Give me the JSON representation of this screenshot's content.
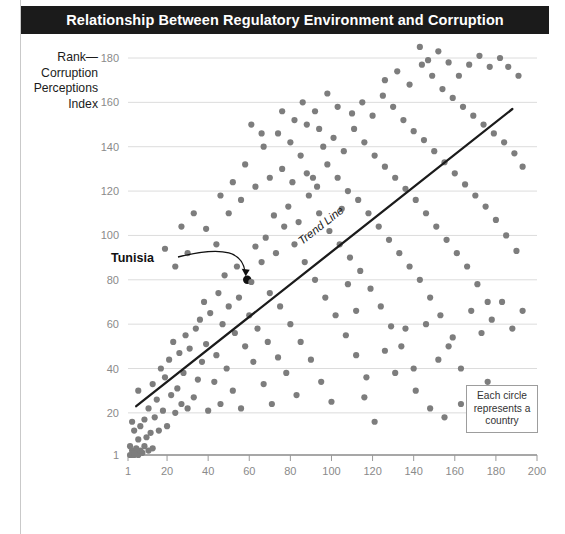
{
  "figure": {
    "title": "Relationship Between Regulatory Environment and Corruption",
    "legend_note": "Each circle represents a country"
  },
  "chart_data": {
    "type": "scatter",
    "title": "Relationship Between Regulatory Environment and Corruption",
    "xlabel": "Rank—Ease of Doing Business",
    "ylabel": "Rank—Corruption Perceptions Index",
    "xlim": [
      1,
      200
    ],
    "ylim": [
      1,
      188
    ],
    "grid": "horizontal",
    "legend_position": "bottom-right",
    "xticks": [
      1,
      20,
      40,
      60,
      80,
      100,
      120,
      140,
      160,
      180,
      200
    ],
    "yticks": [
      1,
      20,
      40,
      60,
      80,
      100,
      120,
      140,
      160,
      180
    ],
    "marker_color": "#7d7d7d",
    "highlight_color": "#111111",
    "annotations": [
      {
        "label": "Tunisia",
        "x": 59,
        "y": 80,
        "kind": "point-callout"
      },
      {
        "label": "Trend Line",
        "x": 98,
        "y": 96,
        "kind": "line-label"
      }
    ],
    "trendline": {
      "x1": 5,
      "y1": 23,
      "x2": 188,
      "y2": 157,
      "color": "#1b1b1b"
    },
    "points": [
      [
        2,
        1
      ],
      [
        3,
        1
      ],
      [
        4,
        1
      ],
      [
        5,
        2
      ],
      [
        6,
        1
      ],
      [
        7,
        3
      ],
      [
        3,
        3
      ],
      [
        4,
        2
      ],
      [
        8,
        2
      ],
      [
        5,
        4
      ],
      [
        2,
        5
      ],
      [
        9,
        5
      ],
      [
        11,
        3
      ],
      [
        13,
        4
      ],
      [
        6,
        8
      ],
      [
        10,
        9
      ],
      [
        12,
        11
      ],
      [
        4,
        12
      ],
      [
        7,
        14
      ],
      [
        16,
        12
      ],
      [
        3,
        16
      ],
      [
        9,
        17
      ],
      [
        14,
        18
      ],
      [
        20,
        14
      ],
      [
        18,
        21
      ],
      [
        11,
        22
      ],
      [
        24,
        20
      ],
      [
        15,
        26
      ],
      [
        22,
        28
      ],
      [
        27,
        24
      ],
      [
        6,
        30
      ],
      [
        13,
        33
      ],
      [
        19,
        36
      ],
      [
        25,
        31
      ],
      [
        30,
        22
      ],
      [
        33,
        27
      ],
      [
        17,
        40
      ],
      [
        28,
        38
      ],
      [
        35,
        35
      ],
      [
        40,
        21
      ],
      [
        21,
        44
      ],
      [
        26,
        47
      ],
      [
        31,
        49
      ],
      [
        37,
        43
      ],
      [
        43,
        34
      ],
      [
        46,
        24
      ],
      [
        23,
        52
      ],
      [
        29,
        55
      ],
      [
        34,
        58
      ],
      [
        39,
        51
      ],
      [
        44,
        46
      ],
      [
        49,
        40
      ],
      [
        52,
        30
      ],
      [
        56,
        22
      ],
      [
        36,
        62
      ],
      [
        41,
        65
      ],
      [
        47,
        60
      ],
      [
        53,
        56
      ],
      [
        58,
        50
      ],
      [
        62,
        43
      ],
      [
        67,
        33
      ],
      [
        71,
        24
      ],
      [
        38,
        70
      ],
      [
        45,
        74
      ],
      [
        50,
        68
      ],
      [
        55,
        72
      ],
      [
        60,
        64
      ],
      [
        64,
        58
      ],
      [
        69,
        52
      ],
      [
        74,
        45
      ],
      [
        78,
        38
      ],
      [
        83,
        28
      ],
      [
        59,
        80
      ],
      [
        48,
        82
      ],
      [
        54,
        86
      ],
      [
        61,
        79
      ],
      [
        66,
        88
      ],
      [
        70,
        74
      ],
      [
        75,
        68
      ],
      [
        80,
        60
      ],
      [
        85,
        52
      ],
      [
        90,
        44
      ],
      [
        95,
        34
      ],
      [
        100,
        25
      ],
      [
        63,
        95
      ],
      [
        68,
        99
      ],
      [
        73,
        92
      ],
      [
        77,
        104
      ],
      [
        82,
        96
      ],
      [
        87,
        88
      ],
      [
        92,
        80
      ],
      [
        97,
        72
      ],
      [
        102,
        64
      ],
      [
        107,
        55
      ],
      [
        112,
        46
      ],
      [
        117,
        36
      ],
      [
        72,
        109
      ],
      [
        79,
        113
      ],
      [
        84,
        106
      ],
      [
        89,
        118
      ],
      [
        94,
        110
      ],
      [
        99,
        102
      ],
      [
        104,
        96
      ],
      [
        109,
        90
      ],
      [
        114,
        84
      ],
      [
        119,
        76
      ],
      [
        124,
        68
      ],
      [
        129,
        59
      ],
      [
        134,
        50
      ],
      [
        140,
        40
      ],
      [
        81,
        124
      ],
      [
        88,
        128
      ],
      [
        93,
        122
      ],
      [
        98,
        132
      ],
      [
        103,
        126
      ],
      [
        108,
        120
      ],
      [
        113,
        116
      ],
      [
        118,
        110
      ],
      [
        123,
        104
      ],
      [
        128,
        98
      ],
      [
        133,
        92
      ],
      [
        138,
        86
      ],
      [
        143,
        80
      ],
      [
        148,
        72
      ],
      [
        153,
        64
      ],
      [
        159,
        54
      ],
      [
        96,
        140
      ],
      [
        101,
        144
      ],
      [
        106,
        138
      ],
      [
        111,
        148
      ],
      [
        116,
        142
      ],
      [
        121,
        136
      ],
      [
        126,
        131
      ],
      [
        131,
        126
      ],
      [
        136,
        121
      ],
      [
        141,
        116
      ],
      [
        146,
        110
      ],
      [
        151,
        104
      ],
      [
        156,
        98
      ],
      [
        161,
        92
      ],
      [
        166,
        86
      ],
      [
        171,
        78
      ],
      [
        176,
        70
      ],
      [
        110,
        155
      ],
      [
        115,
        160
      ],
      [
        120,
        154
      ],
      [
        125,
        163
      ],
      [
        130,
        158
      ],
      [
        135,
        152
      ],
      [
        140,
        147
      ],
      [
        145,
        143
      ],
      [
        150,
        138
      ],
      [
        155,
        133
      ],
      [
        160,
        128
      ],
      [
        165,
        123
      ],
      [
        170,
        118
      ],
      [
        175,
        113
      ],
      [
        180,
        107
      ],
      [
        185,
        100
      ],
      [
        190,
        93
      ],
      [
        126,
        170
      ],
      [
        132,
        174
      ],
      [
        138,
        168
      ],
      [
        144,
        177
      ],
      [
        149,
        172
      ],
      [
        154,
        166
      ],
      [
        159,
        162
      ],
      [
        164,
        158
      ],
      [
        169,
        154
      ],
      [
        174,
        150
      ],
      [
        179,
        146
      ],
      [
        184,
        142
      ],
      [
        189,
        137
      ],
      [
        193,
        131
      ],
      [
        186,
        176
      ],
      [
        191,
        172
      ],
      [
        182,
        180
      ],
      [
        177,
        176
      ],
      [
        172,
        181
      ],
      [
        167,
        177
      ],
      [
        162,
        172
      ],
      [
        157,
        178
      ],
      [
        152,
        183
      ],
      [
        147,
        179
      ],
      [
        143,
        185
      ],
      [
        105,
        112
      ],
      [
        108,
        78
      ],
      [
        112,
        66
      ],
      [
        116,
        27
      ],
      [
        121,
        16
      ],
      [
        126,
        48
      ],
      [
        131,
        38
      ],
      [
        136,
        58
      ],
      [
        141,
        30
      ],
      [
        146,
        60
      ],
      [
        152,
        44
      ],
      [
        157,
        50
      ],
      [
        163,
        40
      ],
      [
        168,
        66
      ],
      [
        173,
        56
      ],
      [
        178,
        62
      ],
      [
        183,
        70
      ],
      [
        188,
        58
      ],
      [
        193,
        66
      ],
      [
        148,
        22
      ],
      [
        155,
        18
      ],
      [
        163,
        24
      ],
      [
        170,
        28
      ],
      [
        176,
        34
      ],
      [
        181,
        20
      ],
      [
        44,
        96
      ],
      [
        39,
        103
      ],
      [
        33,
        110
      ],
      [
        27,
        104
      ],
      [
        50,
        110
      ],
      [
        56,
        116
      ],
      [
        52,
        124
      ],
      [
        46,
        118
      ],
      [
        63,
        122
      ],
      [
        58,
        132
      ],
      [
        70,
        126
      ],
      [
        76,
        130
      ],
      [
        85,
        136
      ],
      [
        91,
        126
      ],
      [
        67,
        140
      ],
      [
        74,
        146
      ],
      [
        80,
        142
      ],
      [
        30,
        92
      ],
      [
        24,
        86
      ],
      [
        19,
        94
      ],
      [
        86,
        160
      ],
      [
        92,
        156
      ],
      [
        98,
        164
      ],
      [
        103,
        158
      ],
      [
        88,
        150
      ],
      [
        94,
        148
      ],
      [
        76,
        156
      ],
      [
        82,
        152
      ],
      [
        61,
        150
      ],
      [
        66,
        146
      ]
    ]
  }
}
